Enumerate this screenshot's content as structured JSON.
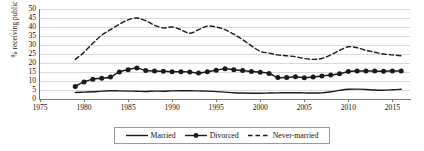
{
  "chart_data": {
    "type": "line",
    "title": "",
    "xlabel": "",
    "ylabel": "% receiving public aid",
    "xlim": [
      1975,
      2017
    ],
    "ylim": [
      0,
      50
    ],
    "grid": true,
    "legend_position": "bottom",
    "x_ticks": [
      "1975",
      "1980",
      "1985",
      "1990",
      "1995",
      "2000",
      "2005",
      "2010",
      "2015"
    ],
    "y_ticks": [
      "0",
      "5",
      "10",
      "15",
      "20",
      "25",
      "30",
      "35",
      "40",
      "45",
      "50"
    ],
    "x": [
      1979,
      1980,
      1981,
      1982,
      1983,
      1984,
      1985,
      1986,
      1987,
      1988,
      1989,
      1990,
      1991,
      1992,
      1993,
      1994,
      1995,
      1996,
      1997,
      1998,
      1999,
      2000,
      2001,
      2002,
      2003,
      2004,
      2005,
      2006,
      2007,
      2008,
      2009,
      2010,
      2011,
      2012,
      2013,
      2014,
      2015,
      2016
    ],
    "series": [
      {
        "name": "Married",
        "style": "solid",
        "marker": "none",
        "color": "#1a1a1a",
        "values": [
          3.6,
          3.8,
          4.0,
          4.4,
          4.6,
          4.5,
          4.4,
          4.3,
          4.2,
          4.4,
          4.3,
          4.5,
          4.6,
          4.6,
          4.5,
          4.4,
          4.1,
          3.8,
          3.5,
          3.3,
          3.2,
          3.2,
          3.3,
          3.4,
          3.5,
          3.5,
          3.4,
          3.3,
          3.4,
          4.0,
          4.8,
          5.4,
          5.5,
          5.3,
          5.0,
          4.9,
          5.1,
          5.4
        ]
      },
      {
        "name": "Divorced",
        "style": "solid",
        "marker": "circle",
        "color": "#1a1a1a",
        "values": [
          7.0,
          9.5,
          11.0,
          11.5,
          12.2,
          15.0,
          16.3,
          17.2,
          15.8,
          15.5,
          15.4,
          15.2,
          15.1,
          15.0,
          14.4,
          15.2,
          16.0,
          16.8,
          16.2,
          15.8,
          15.3,
          14.8,
          14.2,
          11.9,
          12.0,
          12.3,
          11.8,
          12.2,
          12.8,
          13.3,
          14.0,
          15.3,
          15.6,
          15.5,
          15.5,
          15.4,
          15.6,
          15.6
        ]
      },
      {
        "name": "Never-married",
        "style": "dashed",
        "marker": "none",
        "color": "#1a1a1a",
        "values": [
          22.0,
          26.0,
          31.0,
          35.5,
          38.5,
          41.5,
          44.0,
          45.0,
          43.5,
          41.0,
          39.5,
          40.0,
          38.5,
          36.5,
          38.5,
          40.5,
          40.0,
          38.5,
          36.0,
          33.0,
          29.5,
          26.5,
          25.5,
          24.5,
          24.0,
          23.5,
          22.5,
          22.0,
          22.5,
          24.5,
          27.0,
          29.0,
          28.5,
          27.0,
          26.0,
          25.0,
          24.5,
          24.0
        ]
      }
    ]
  },
  "legend": {
    "items": [
      {
        "label": "Married",
        "icon": "solid-line-swatch"
      },
      {
        "label": "Divorced",
        "icon": "line-with-circle-marker-swatch"
      },
      {
        "label": "Never-married",
        "icon": "dashed-line-swatch"
      }
    ]
  },
  "axes": {
    "y_title": "% receiving public aid"
  }
}
